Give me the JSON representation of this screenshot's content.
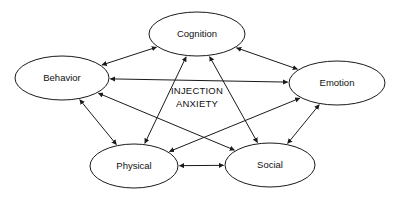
{
  "diagram": {
    "center_label": {
      "line1": "INJECTION",
      "line2": "ANXIETY"
    },
    "background_color": "#ffffff",
    "stroke_color": "#1a1a1a",
    "node_fill_color": "#ffffff",
    "nodes": [
      {
        "id": "cognition",
        "label": "Cognition",
        "cx": 197,
        "cy": 34,
        "rx": 48,
        "ry": 22
      },
      {
        "id": "behavior",
        "label": "Behavior",
        "cx": 62,
        "cy": 78,
        "rx": 47,
        "ry": 22
      },
      {
        "id": "emotion",
        "label": "Emotion",
        "cx": 337,
        "cy": 83,
        "rx": 48,
        "ry": 22
      },
      {
        "id": "physical",
        "label": "Physical",
        "cx": 134,
        "cy": 166,
        "rx": 44,
        "ry": 22
      },
      {
        "id": "social",
        "label": "Social",
        "cx": 270,
        "cy": 165,
        "rx": 45,
        "ry": 22
      }
    ],
    "edges": [
      {
        "id": "behavior-cognition",
        "from": "behavior",
        "to": "cognition",
        "arrows": "both"
      },
      {
        "id": "cognition-emotion",
        "from": "cognition",
        "to": "emotion",
        "arrows": "both"
      },
      {
        "id": "behavior-emotion",
        "from": "behavior",
        "to": "emotion",
        "arrows": "both"
      },
      {
        "id": "behavior-physical",
        "from": "behavior",
        "to": "physical",
        "arrows": "both"
      },
      {
        "id": "emotion-social",
        "from": "emotion",
        "to": "social",
        "arrows": "both"
      },
      {
        "id": "cognition-physical",
        "from": "cognition",
        "to": "physical",
        "arrows": "both"
      },
      {
        "id": "cognition-social",
        "from": "cognition",
        "to": "social",
        "arrows": "both"
      },
      {
        "id": "behavior-social",
        "from": "behavior",
        "to": "social",
        "arrows": "both"
      },
      {
        "id": "emotion-physical",
        "from": "emotion",
        "to": "physical",
        "arrows": "both"
      },
      {
        "id": "physical-social",
        "from": "physical",
        "to": "social",
        "arrows": "both"
      }
    ]
  }
}
